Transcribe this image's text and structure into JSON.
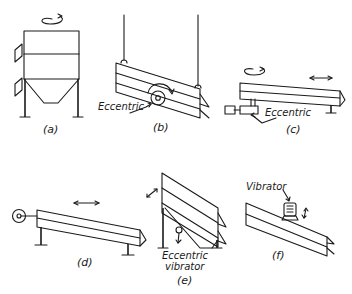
{
  "figure": {
    "panels": [
      {
        "id": "a",
        "label": "(a)",
        "description": "Gyratory screen (rotating)",
        "annotations": []
      },
      {
        "id": "b",
        "label": "(b)",
        "description": "Suspended inclined screen with eccentric",
        "annotations": [
          "Eccentric"
        ]
      },
      {
        "id": "c",
        "label": "(c)",
        "description": "Horizontal screen driven by eccentric",
        "annotations": [
          "Eccentric"
        ]
      },
      {
        "id": "d",
        "label": "(d)",
        "description": "Reciprocating screen with crank",
        "annotations": []
      },
      {
        "id": "e",
        "label": "(e)",
        "description": "Inclined screen with eccentric vibrator",
        "annotations": [
          "Eccentric",
          "vibrator"
        ]
      },
      {
        "id": "f",
        "label": "(f)",
        "description": "Inclined screen with top-mounted vibrator",
        "annotations": [
          "Vibrator"
        ]
      }
    ]
  },
  "labels": {
    "a": "(a)",
    "b": "(b)",
    "c": "(c)",
    "d": "(d)",
    "e": "(e)",
    "f": "(f)",
    "b_eccentric": "Eccentric",
    "c_eccentric": "Eccentric",
    "e_eccentric": "Eccentric",
    "e_vibrator": "vibrator",
    "f_vibrator": "Vibrator"
  },
  "colors": {
    "ink": "#1a1a1a",
    "background": "#ffffff"
  }
}
